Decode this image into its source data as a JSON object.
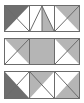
{
  "figure": {
    "background_color": "#ffffff",
    "border_color": "#6b6b6b",
    "width_px": 84,
    "height_px": 103
  },
  "palette": {
    "white": "#ffffff",
    "light_gray": "#b5b5b5",
    "dark_gray": "#6e6e6e",
    "outline": "#6b6b6b"
  },
  "rows": [
    {
      "name": "row-1",
      "label": "Row 1",
      "x": 4,
      "y": 5,
      "width": 76,
      "height": 27,
      "cells": [
        {
          "name": "row1-cell1",
          "label": "Cell 1",
          "shape": "upper-left",
          "fill": "#6e6e6e",
          "base": "#ffffff",
          "diagonal": "tl-br"
        },
        {
          "name": "row1-cell2",
          "label": "Cell 2",
          "shape": "split-peak",
          "fill_left": "#ffffff",
          "fill_right": "#b5b5b5",
          "base": "#ffffff",
          "diagonal": "peak"
        },
        {
          "name": "row1-cell3",
          "label": "Cell 3",
          "shape": "upper-right",
          "fill": "#b5b5b5",
          "base": "#ffffff",
          "diagonal": "bl-tr"
        }
      ]
    },
    {
      "name": "row-2",
      "label": "Row 2",
      "x": 4,
      "y": 38,
      "width": 76,
      "height": 27,
      "cells": [
        {
          "name": "row2-cell1",
          "label": "Cell 1",
          "shape": "upper-right",
          "fill": "#b5b5b5",
          "base": "#ffffff",
          "diagonal": "bl-tr"
        },
        {
          "name": "row2-cell2",
          "label": "Cell 2",
          "shape": "full",
          "fill": "#b5b5b5",
          "base": "#b5b5b5",
          "diagonal": "none"
        },
        {
          "name": "row2-cell3",
          "label": "Cell 3",
          "shape": "upper-right",
          "fill": "#b5b5b5",
          "base": "#ffffff",
          "diagonal": "bl-tr"
        }
      ]
    },
    {
      "name": "row-3",
      "label": "Row 3",
      "x": 4,
      "y": 71,
      "width": 76,
      "height": 28,
      "cells": [
        {
          "name": "row3-cell1",
          "label": "Cell 1",
          "shape": "lower-left",
          "fill": "#6e6e6e",
          "base": "#ffffff",
          "diagonal": "bl-tr"
        },
        {
          "name": "row3-cell2",
          "label": "Cell 2",
          "shape": "upper-left",
          "fill": "#b5b5b5",
          "base": "#ffffff",
          "diagonal": "tl-br"
        },
        {
          "name": "row3-cell3",
          "label": "Cell 3",
          "shape": "lower-right",
          "fill": "#b5b5b5",
          "base": "#ffffff",
          "diagonal": "tl-br"
        }
      ]
    }
  ]
}
